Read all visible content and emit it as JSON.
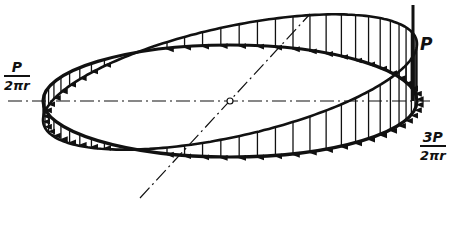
{
  "figure": {
    "labels": {
      "force": "P",
      "left_load": {
        "numerator": "P",
        "denominator": "2πr"
      },
      "right_load": {
        "numerator": "3P",
        "denominator": "2πr"
      }
    },
    "colors": {
      "ink": "#111111",
      "background": "#ffffff"
    },
    "geometry": {
      "ring_center": [
        230,
        101
      ],
      "ring_rx": 187,
      "ring_ry": 56,
      "axis_horizontal": {
        "x1": 8,
        "x2": 432,
        "y": 101
      },
      "axis_diagonal": {
        "x1": 140,
        "y1": 198,
        "x2": 310,
        "y2": 14
      },
      "force_line": {
        "x": 413,
        "y1": 5,
        "y2": 101
      },
      "load_left_magnitude": 1,
      "load_right_magnitude": 3,
      "load_scale": 19,
      "arrow_count": 64
    }
  }
}
